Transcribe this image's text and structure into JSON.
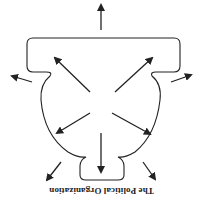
{
  "diagram": {
    "title": "The Political Organization",
    "orientation": "rotated-180",
    "stroke_color": "#222222",
    "background": "#ffffff",
    "shape": "organization-outline",
    "arrows": [
      {
        "direction": "up",
        "from": [
          101,
          30
        ],
        "to": [
          101,
          5
        ]
      },
      {
        "direction": "up-left",
        "from": [
          90,
          92
        ],
        "to": [
          55,
          58
        ]
      },
      {
        "direction": "up-right",
        "from": [
          115,
          92
        ],
        "to": [
          152,
          58
        ]
      },
      {
        "direction": "left",
        "from": [
          32,
          82
        ],
        "to": [
          12,
          76
        ]
      },
      {
        "direction": "right",
        "from": [
          171,
          82
        ],
        "to": [
          191,
          75
        ]
      },
      {
        "direction": "down-left",
        "from": [
          90,
          113
        ],
        "to": [
          57,
          133
        ]
      },
      {
        "direction": "down-right",
        "from": [
          112,
          113
        ],
        "to": [
          150,
          134
        ]
      },
      {
        "direction": "down",
        "from": [
          101,
          133
        ],
        "to": [
          101,
          172
        ]
      },
      {
        "direction": "down-left-outer",
        "from": [
          61,
          162
        ],
        "to": [
          47,
          180
        ]
      },
      {
        "direction": "down-right-outer",
        "from": [
          143,
          162
        ],
        "to": [
          155,
          179
        ]
      }
    ]
  }
}
